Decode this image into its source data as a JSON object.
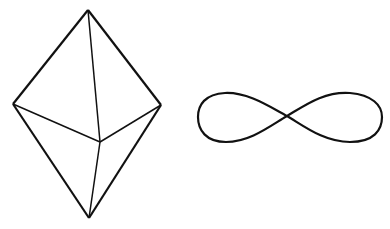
{
  "figures": [
    {
      "id": "bipyramid",
      "description": "Wireframe triangular bipyramid (diamond-like polyhedron)",
      "vertices": {
        "top": [
          88,
          10
        ],
        "bottom": [
          89,
          218
        ],
        "left": [
          13,
          104
        ],
        "right": [
          161,
          105
        ],
        "inner": [
          100,
          142
        ]
      },
      "stroke": "#111111"
    },
    {
      "id": "figure-eight",
      "description": "Figure-eight / lemniscate closed curve",
      "center": [
        287,
        116
      ],
      "left_x": 198,
      "right_x": 382,
      "top_y": 92,
      "bottom_y": 142,
      "stroke": "#111111"
    }
  ]
}
